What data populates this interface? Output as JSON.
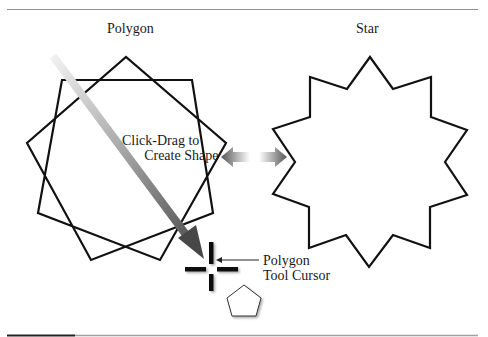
{
  "figure": {
    "titles": {
      "polygon": "Polygon",
      "star": "Star"
    },
    "annotations": {
      "drag_line1": "Click-Drag to",
      "drag_line2": "Create Shape",
      "cursor_line1": "Polygon",
      "cursor_line2": "Tool Cursor"
    },
    "colors": {
      "stroke": "#111111",
      "rule_dark": "#222222",
      "rule_light": "#9a9a9a",
      "arrow_start": "#ececec",
      "arrow_end": "#4a4a4a"
    },
    "icons": {
      "polygon_tool_cursor": "crosshair-icon",
      "polygon_tool_glyph": "pentagon-icon",
      "double_arrow": "double-arrow-icon",
      "drag_arrow": "gradient-arrow-icon"
    }
  }
}
